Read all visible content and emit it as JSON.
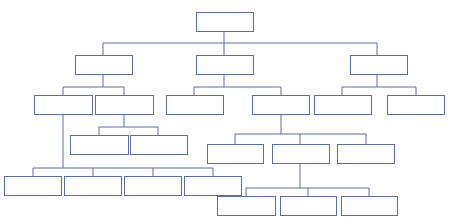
{
  "canvas": {
    "width": 451,
    "height": 222,
    "background": "#ffffff"
  },
  "style": {
    "node_fill": "#ffffff",
    "node_stroke": "#5b6ba5",
    "node_stroke_width": 1,
    "connector_stroke": "#5b6ba5",
    "connector_stroke_width": 1
  },
  "diagram": {
    "type": "tree",
    "title": "",
    "label_text": "",
    "levels": 6,
    "node_count": 26
  },
  "nodes": [
    {
      "id": "n1",
      "label": "",
      "level": 0,
      "x": 196,
      "y": 12,
      "w": 57,
      "h": 19
    },
    {
      "id": "n2",
      "label": "",
      "level": 1,
      "x": 75,
      "y": 55,
      "w": 57,
      "h": 19
    },
    {
      "id": "n3",
      "label": "",
      "level": 1,
      "x": 196,
      "y": 55,
      "w": 57,
      "h": 19
    },
    {
      "id": "n4",
      "label": "",
      "level": 1,
      "x": 350,
      "y": 55,
      "w": 57,
      "h": 19
    },
    {
      "id": "n5",
      "label": "",
      "level": 2,
      "x": 34,
      "y": 95,
      "w": 58,
      "h": 19
    },
    {
      "id": "n6",
      "label": "",
      "level": 2,
      "x": 95,
      "y": 95,
      "w": 58,
      "h": 19
    },
    {
      "id": "n7",
      "label": "",
      "level": 2,
      "x": 166,
      "y": 95,
      "w": 57,
      "h": 19
    },
    {
      "id": "n8",
      "label": "",
      "level": 2,
      "x": 252,
      "y": 95,
      "w": 57,
      "h": 19
    },
    {
      "id": "n9",
      "label": "",
      "level": 2,
      "x": 314,
      "y": 95,
      "w": 57,
      "h": 19
    },
    {
      "id": "n10",
      "label": "",
      "level": 2,
      "x": 387,
      "y": 95,
      "w": 57,
      "h": 19
    },
    {
      "id": "n11",
      "label": "",
      "level": 3,
      "x": 70,
      "y": 135,
      "w": 58,
      "h": 19
    },
    {
      "id": "n12",
      "label": "",
      "level": 3,
      "x": 130,
      "y": 135,
      "w": 57,
      "h": 19
    },
    {
      "id": "n13",
      "label": "",
      "level": 3,
      "x": 207,
      "y": 144,
      "w": 56,
      "h": 19
    },
    {
      "id": "n14",
      "label": "",
      "level": 3,
      "x": 272,
      "y": 144,
      "w": 57,
      "h": 19
    },
    {
      "id": "n15",
      "label": "",
      "level": 3,
      "x": 337,
      "y": 144,
      "w": 57,
      "h": 19
    },
    {
      "id": "n16",
      "label": "",
      "level": 4,
      "x": 4,
      "y": 176,
      "w": 57,
      "h": 19
    },
    {
      "id": "n17",
      "label": "",
      "level": 4,
      "x": 64,
      "y": 176,
      "w": 57,
      "h": 19
    },
    {
      "id": "n18",
      "label": "",
      "level": 4,
      "x": 124,
      "y": 176,
      "w": 57,
      "h": 19
    },
    {
      "id": "n19",
      "label": "",
      "level": 4,
      "x": 184,
      "y": 176,
      "w": 57,
      "h": 19
    },
    {
      "id": "n20",
      "label": "",
      "level": 5,
      "x": 217,
      "y": 196,
      "w": 58,
      "h": 19
    },
    {
      "id": "n21",
      "label": "",
      "level": 5,
      "x": 280,
      "y": 196,
      "w": 56,
      "h": 19
    },
    {
      "id": "n22",
      "label": "",
      "level": 5,
      "x": 341,
      "y": 196,
      "w": 56,
      "h": 19
    }
  ],
  "connectors": [
    {
      "id": "c-root-stem",
      "points": "224,31 224,43"
    },
    {
      "id": "c-level1-bus",
      "points": "103,43 377,43"
    },
    {
      "id": "c-level1-l-drop",
      "points": "103,43 103,55"
    },
    {
      "id": "c-level1-m-drop",
      "points": "224,43 224,55"
    },
    {
      "id": "c-level1-r-drop",
      "points": "377,43 377,55"
    },
    {
      "id": "c-n2-stem",
      "points": "103,74 103,87"
    },
    {
      "id": "c-n2-bus",
      "points": "63,87 124,87"
    },
    {
      "id": "c-n5-drop",
      "points": "63,87 63,95"
    },
    {
      "id": "c-n6-drop",
      "points": "124,87 124,95"
    },
    {
      "id": "c-n3-stem",
      "points": "224,74 224,87"
    },
    {
      "id": "c-n3-bus",
      "points": "194,87 281,87"
    },
    {
      "id": "c-n7-drop",
      "points": "194,87 194,95"
    },
    {
      "id": "c-n8-drop",
      "points": "281,87 281,95"
    },
    {
      "id": "c-n4-stem",
      "points": "377,74 377,87"
    },
    {
      "id": "c-n4-bus",
      "points": "342,87 416,87"
    },
    {
      "id": "c-n9-drop",
      "points": "342,87 342,95"
    },
    {
      "id": "c-n10-drop",
      "points": "416,87 416,95"
    },
    {
      "id": "c-n5-long-stem",
      "points": "63,114 63,168"
    },
    {
      "id": "c-n6-stem",
      "points": "124,114 124,127"
    },
    {
      "id": "c-n6-bus",
      "points": "99,127 158,127"
    },
    {
      "id": "c-n11-drop",
      "points": "99,127 99,135"
    },
    {
      "id": "c-n12-drop",
      "points": "158,127 158,135"
    },
    {
      "id": "c-n8-stem",
      "points": "281,114 281,134"
    },
    {
      "id": "c-n8-bus",
      "points": "235,134 366,134"
    },
    {
      "id": "c-n13-drop",
      "points": "235,134 235,144"
    },
    {
      "id": "c-n14-drop",
      "points": "300,134 300,144"
    },
    {
      "id": "c-n15-drop",
      "points": "366,134 366,144"
    },
    {
      "id": "c-bottom-bus",
      "points": "33,168 213,168"
    },
    {
      "id": "c-n16-drop",
      "points": "33,168 33,176"
    },
    {
      "id": "c-n17-drop",
      "points": "93,168 93,176"
    },
    {
      "id": "c-n18-drop",
      "points": "153,168 153,176"
    },
    {
      "id": "c-n19-drop",
      "points": "213,168 213,176"
    },
    {
      "id": "c-n14-stem",
      "points": "300,163 300,188"
    },
    {
      "id": "c-n14-bus",
      "points": "246,188 369,188"
    },
    {
      "id": "c-n20-drop",
      "points": "246,188 246,196"
    },
    {
      "id": "c-n21-drop",
      "points": "308,188 308,196"
    },
    {
      "id": "c-n22-drop",
      "points": "369,188 369,196"
    }
  ]
}
